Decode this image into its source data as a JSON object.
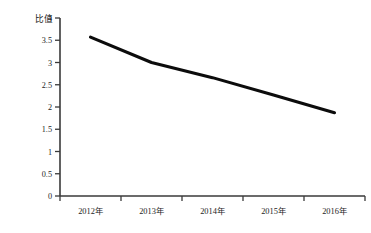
{
  "chart_data": {
    "type": "line",
    "title": "",
    "subtitle": "",
    "ylabel": "比值",
    "xlabel": "",
    "categories": [
      "2012年",
      "2013年",
      "2014年",
      "2015年",
      "2016年"
    ],
    "series": [
      {
        "name": "比值",
        "values": [
          3.57,
          3.0,
          2.66,
          2.27,
          1.87
        ],
        "color": "#0c0c0c"
      }
    ],
    "ylim": [
      0,
      4
    ],
    "ytick_values": [
      0,
      0.5,
      1,
      1.5,
      2,
      2.5,
      3,
      3.5,
      4
    ],
    "ytick_labels": [
      "0",
      "0.5",
      "1",
      "1.5",
      "2",
      "2.5",
      "3",
      "3.5",
      "4"
    ],
    "grid": false,
    "legend": false,
    "legend_position": "none",
    "background_color": "#ffffff",
    "axis_color": "#3a3a3a"
  }
}
